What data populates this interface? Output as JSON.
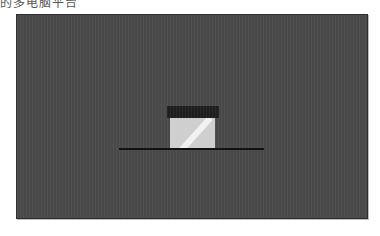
{
  "caption": {
    "text": "的多电脑平台"
  },
  "scene": {
    "panel_color": "#4b4b4b",
    "lid_color": "#1e1e1e",
    "box_color": "#cfcfcf",
    "highlight_color": "#f2f2f2",
    "ground_color": "#111111"
  }
}
